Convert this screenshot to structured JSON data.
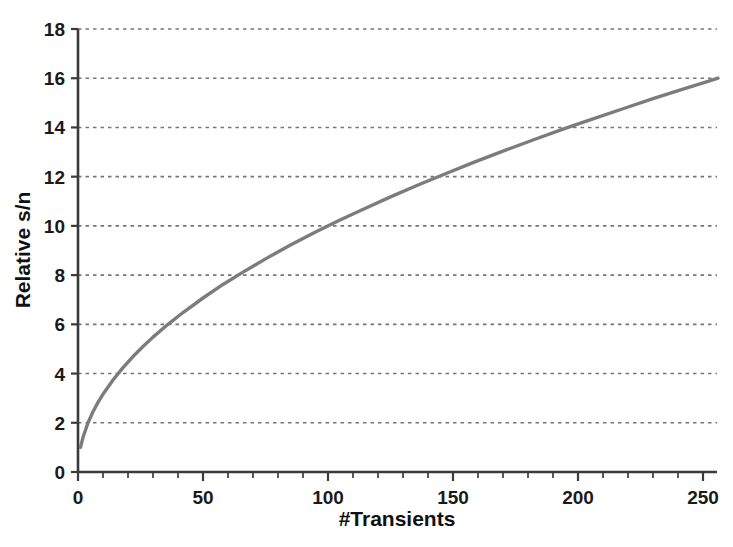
{
  "chart_data": {
    "type": "line",
    "title": "",
    "subtitle": "",
    "xlabel": "#Transients",
    "ylabel": "Relative s/n",
    "xlim": [
      0,
      256
    ],
    "ylim": [
      0,
      18
    ],
    "xticks": [
      0,
      50,
      100,
      150,
      200,
      250
    ],
    "xtick_labels": [
      "0",
      "50",
      "100",
      "150",
      "200",
      "250"
    ],
    "xminor_step": 10,
    "yticks": [
      0,
      2,
      4,
      6,
      8,
      10,
      12,
      14,
      16,
      18
    ],
    "ytick_labels": [
      "0",
      "2",
      "4",
      "6",
      "8",
      "10",
      "12",
      "14",
      "16",
      "18"
    ],
    "grid": {
      "horizontal": true,
      "vertical": false,
      "style": "dotted",
      "color": "#777777"
    },
    "legend": {
      "visible": false,
      "position": "none"
    },
    "annotations": [],
    "series": [
      {
        "name": "Relative s/n",
        "color": "#7c7c7c",
        "line_width": 3.4,
        "relation": "s/n = sqrt(#Transients)",
        "x": [
          1,
          2,
          4,
          6,
          8,
          10,
          14,
          18,
          22,
          26,
          30,
          36,
          42,
          50,
          58,
          66,
          75,
          85,
          95,
          105,
          115,
          125,
          136,
          147,
          158,
          170,
          182,
          194,
          206,
          218,
          230,
          242,
          252,
          256
        ],
        "y": [
          1.0,
          1.41,
          2.0,
          2.45,
          2.83,
          3.16,
          3.74,
          4.24,
          4.69,
          5.1,
          5.48,
          6.0,
          6.48,
          7.07,
          7.62,
          8.12,
          8.66,
          9.22,
          9.75,
          10.25,
          10.72,
          11.18,
          11.66,
          12.12,
          12.57,
          13.04,
          13.49,
          13.93,
          14.35,
          14.76,
          15.17,
          15.56,
          15.87,
          16.0
        ]
      }
    ]
  },
  "axes": {
    "x_axis_label": "#Transients",
    "y_axis_label": "Relative s/n"
  }
}
